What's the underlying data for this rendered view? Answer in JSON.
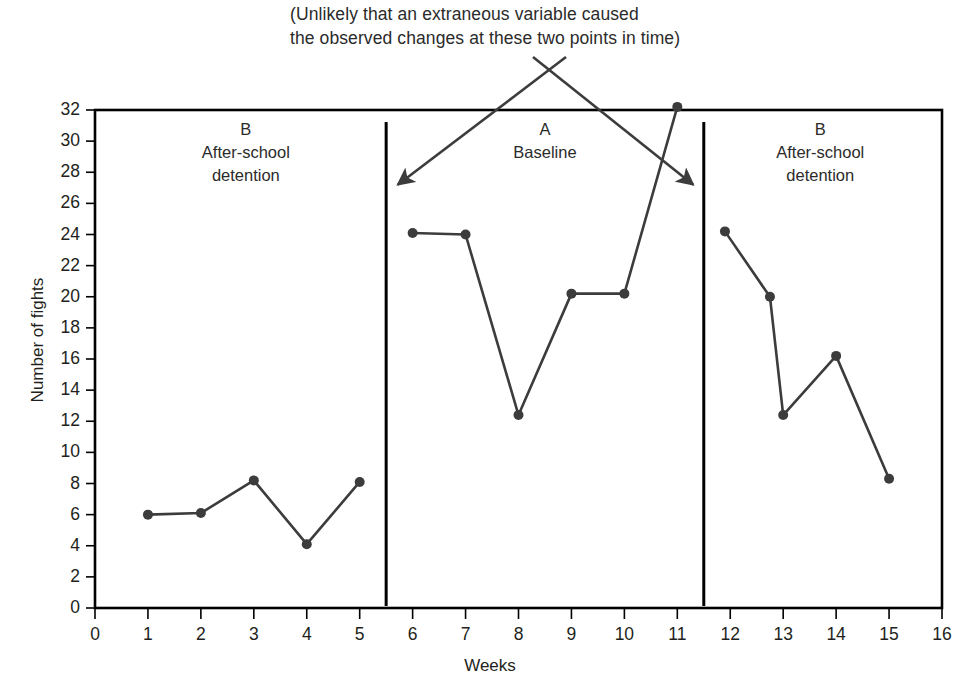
{
  "figure": {
    "annotation": "(Unlikely that an extraneous variable caused\nthe observed changes at these two points in time)",
    "line_color": "#3c3c3c",
    "frame_color": "#000000",
    "text_color": "#231f20"
  },
  "chart_data": {
    "type": "line",
    "title": "",
    "xlabel": "Weeks",
    "ylabel": "Number of fights",
    "xlim": [
      0,
      16
    ],
    "ylim": [
      0,
      32
    ],
    "grid": false,
    "legend": "none",
    "xticks": [
      0,
      1,
      2,
      3,
      4,
      5,
      6,
      7,
      8,
      9,
      10,
      11,
      12,
      13,
      14,
      15,
      16
    ],
    "yticks": [
      0,
      2,
      4,
      6,
      8,
      10,
      12,
      14,
      16,
      18,
      20,
      22,
      24,
      26,
      28,
      30,
      32
    ],
    "xtick_labels": [
      "0",
      "1",
      "2",
      "3",
      "4",
      "5",
      "6",
      "7",
      "8",
      "9",
      "10",
      "11",
      "12",
      "13",
      "14",
      "15",
      "16"
    ],
    "ytick_labels": [
      "0",
      "2",
      "4",
      "6",
      "8",
      "10",
      "12",
      "14",
      "16",
      "18",
      "20",
      "22",
      "24",
      "26",
      "28",
      "30",
      "32"
    ],
    "series": [
      {
        "name": "Phase B1 - After-school detention",
        "x": [
          1,
          2,
          3,
          4,
          5
        ],
        "values": [
          6.0,
          6.1,
          8.2,
          4.1,
          8.1
        ]
      },
      {
        "name": "Phase A - Baseline",
        "x": [
          6,
          7,
          8,
          9,
          10,
          11
        ],
        "values": [
          24.1,
          24.0,
          12.4,
          20.2,
          20.2,
          32.2
        ]
      },
      {
        "name": "Phase B2 - After-school detention",
        "x": [
          11.9,
          12.75,
          13,
          14,
          15
        ],
        "values": [
          24.2,
          20.0,
          12.4,
          16.2,
          8.3
        ]
      }
    ],
    "phase_dividers": [
      5.5,
      11.5
    ],
    "phases": [
      {
        "letter": "B",
        "name": "After-school\ndetention",
        "center_x": 2.85
      },
      {
        "letter": "A",
        "name": "Baseline",
        "center_x": 8.5
      },
      {
        "letter": "B",
        "name": "After-school\ndetention",
        "center_x": 13.7
      }
    ],
    "annotations": [
      {
        "text": "(Unlikely that an extraneous variable caused\nthe observed changes at these two points in time)",
        "arrow_targets": [
          {
            "x": 5.72,
            "y": 27.2
          },
          {
            "x": 11.3,
            "y": 27.2
          }
        ]
      }
    ]
  }
}
